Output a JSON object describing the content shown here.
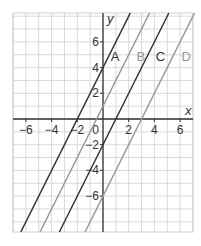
{
  "chart_data": {
    "type": "line",
    "title": "",
    "xlabel": "x",
    "ylabel": "y",
    "xlim": [
      -7,
      7
    ],
    "ylim": [
      -8.8,
      8.3
    ],
    "grid": true,
    "x_ticks": [
      -6,
      -4,
      -2,
      0,
      2,
      4,
      6
    ],
    "y_ticks": [
      6,
      4,
      2,
      -2,
      -4,
      -6
    ],
    "series": [
      {
        "name": "A",
        "equation": "y = 2x + 4",
        "slope": 2,
        "intercept": 4,
        "color": "#333333",
        "label_pos": [
          0.6,
          4.5
        ]
      },
      {
        "name": "B",
        "equation": "y = 2x + 1",
        "slope": 2,
        "intercept": 1,
        "color": "#999999",
        "label_pos": [
          2.6,
          4.5
        ]
      },
      {
        "name": "C",
        "equation": "y = 2x - 2",
        "slope": 2,
        "intercept": -2,
        "color": "#333333",
        "label_pos": [
          4.1,
          4.5
        ]
      },
      {
        "name": "D",
        "equation": "y = 2x - 6",
        "slope": 2,
        "intercept": -6,
        "color": "#999999",
        "label_pos": [
          6.1,
          4.5
        ]
      }
    ]
  },
  "labels": {
    "x_axis": "x",
    "y_axis": "y",
    "origin": "0",
    "line_A": "A",
    "line_B": "B",
    "line_C": "C",
    "line_D": "D"
  }
}
